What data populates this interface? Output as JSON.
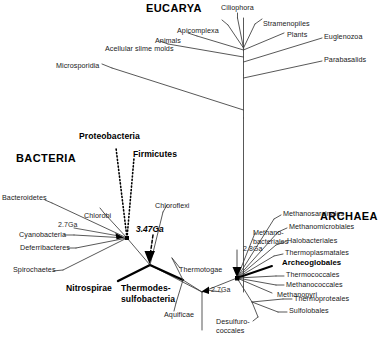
{
  "figure": {
    "type": "phylogenetic-tree"
  },
  "domains": [
    {
      "key": "eucarya",
      "label": "EUCARYA"
    },
    {
      "key": "bacteria",
      "label": "BACTERIA"
    },
    {
      "key": "archaea",
      "label": "ARCHAEA"
    }
  ],
  "eucarya_taxa": [
    {
      "label": "Ciliophora"
    },
    {
      "label": "Apicomplexa"
    },
    {
      "label": "Stramenopiles"
    },
    {
      "label": "Animals"
    },
    {
      "label": "Plants"
    },
    {
      "label": "Euglenozoa"
    },
    {
      "label": "Acellular slime molds"
    },
    {
      "label": "Parabasalids"
    },
    {
      "label": "Microsporidia"
    }
  ],
  "bacteria_taxa": [
    {
      "label": "Proteobacteria",
      "style": "bold"
    },
    {
      "label": "Firmicutes",
      "style": "bold"
    },
    {
      "label": "Bacteroidetes",
      "style": "plain"
    },
    {
      "label": "Chlorobi",
      "style": "plain"
    },
    {
      "label": "Chloroflexi",
      "style": "plain"
    },
    {
      "label": "Cyanobacteria",
      "style": "plain"
    },
    {
      "label": "Deferribacteres",
      "style": "plain"
    },
    {
      "label": "Spirochaetes",
      "style": "plain"
    },
    {
      "label": "Nitrospirae",
      "style": "bold"
    },
    {
      "label": "Thermodes-",
      "style": "bold"
    },
    {
      "label": "sulfobacteria",
      "style": "bold"
    },
    {
      "label": "Thermotogae",
      "style": "plain"
    },
    {
      "label": "Aquificae",
      "style": "plain"
    }
  ],
  "archaea_taxa": [
    {
      "label": "Methanosarcinales"
    },
    {
      "label": "Methanomicrobiales"
    },
    {
      "label": "Halobacteriales"
    },
    {
      "label": "Thermoplasmatales"
    },
    {
      "label": "Methano-"
    },
    {
      "label": "bacteriales"
    },
    {
      "label": "Archeoglobales"
    },
    {
      "label": "Thermococcales"
    },
    {
      "label": "Methanococcales"
    },
    {
      "label": "Methanopyri"
    },
    {
      "label": "Thermoproteales"
    },
    {
      "label": "Desulfuro-"
    },
    {
      "label": "coccales"
    },
    {
      "label": "Sulfolobales"
    }
  ],
  "age_markers": [
    {
      "key": "bacteria_crown",
      "label": "2.7Ga"
    },
    {
      "key": "thermodesulfo",
      "label": "3.47Ga"
    },
    {
      "key": "root_right",
      "label": "2.7Ga"
    },
    {
      "key": "archaea_crown",
      "label": "2.8Ga"
    }
  ],
  "colors": {
    "line": "#3a3a3a",
    "line_dark": "#000000",
    "text": "#1a1a1a",
    "background": "#ffffff"
  }
}
